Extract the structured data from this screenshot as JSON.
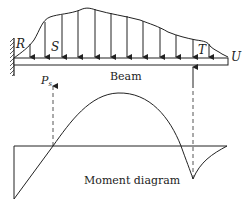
{
  "diagram": {
    "labels": {
      "R": "R",
      "S": "S",
      "T": "T",
      "U": "U",
      "beam": "Beam",
      "ps_main": "P",
      "ps_sub": "s",
      "moment": "Moment diagram"
    },
    "colors": {
      "stroke": "#222222",
      "dashed": "#555555",
      "background": "#ffffff"
    },
    "load_arrow_count": 12
  }
}
